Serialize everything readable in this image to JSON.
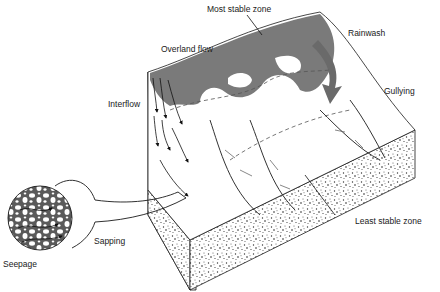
{
  "diagram": {
    "type": "block-diagram",
    "labels": {
      "most_stable_zone": "Most stable zone",
      "overland_flow": "Overland flow",
      "rainwash": "Rainwash",
      "interflow": "Interflow",
      "gullying": "Gullying",
      "least_stable_zone": "Least stable zone",
      "sapping": "Sapping",
      "seepage": "Seepage"
    },
    "colors": {
      "background": "#ffffff",
      "shaded_surface": "#7a7a7a",
      "line": "#1a1a1a",
      "soil_dots": "#333333"
    }
  }
}
